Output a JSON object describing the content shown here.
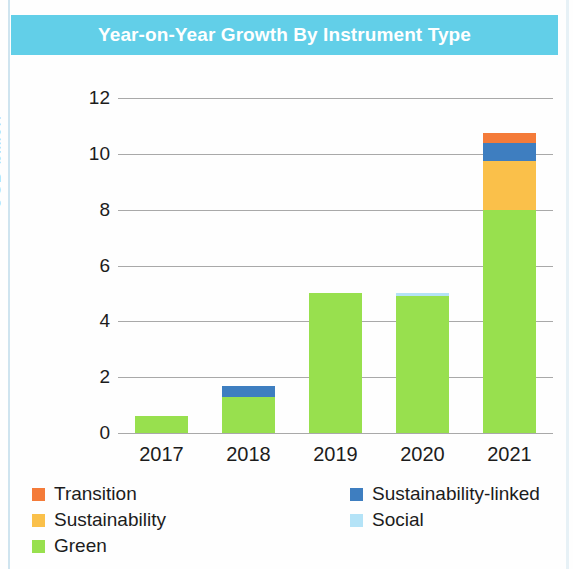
{
  "banner": {
    "title": "Year-on-Year Growth By Instrument Type"
  },
  "axis": {
    "y_title": "USD billion",
    "y_ticks": [
      "12",
      "10",
      "8",
      "6",
      "4",
      "2",
      "0"
    ],
    "x_ticks": [
      "2017",
      "2018",
      "2019",
      "2020",
      "2021"
    ]
  },
  "legend": {
    "left_column": [
      {
        "label": "Transition",
        "color": "#f47b39"
      },
      {
        "label": "Sustainability",
        "color": "#fac04a"
      },
      {
        "label": "Green",
        "color": "#98e04e"
      }
    ],
    "right_column": [
      {
        "label": "Sustainability-linked",
        "color": "#3e7ec0"
      },
      {
        "label": "Social",
        "color": "#b4e3f7"
      }
    ]
  },
  "chart_data": {
    "type": "bar",
    "stacked": true,
    "title": "Year-on-Year Growth By Instrument Type",
    "xlabel": "",
    "ylabel": "USD billion",
    "ylim": [
      0,
      12
    ],
    "ytick_step": 2,
    "grid": true,
    "legend_position": "bottom",
    "categories": [
      "2017",
      "2018",
      "2019",
      "2020",
      "2021"
    ],
    "series": [
      {
        "name": "Green",
        "color": "#98e04e",
        "values": [
          0.6,
          1.3,
          5.0,
          4.9,
          8.0
        ]
      },
      {
        "name": "Social",
        "color": "#b4e3f7",
        "values": [
          0,
          0,
          0,
          0.1,
          0
        ]
      },
      {
        "name": "Sustainability",
        "color": "#fac04a",
        "values": [
          0,
          0,
          0,
          0,
          1.75
        ]
      },
      {
        "name": "Sustainability-linked",
        "color": "#3e7ec0",
        "values": [
          0,
          0.4,
          0,
          0,
          0.65
        ]
      },
      {
        "name": "Transition",
        "color": "#f47b39",
        "values": [
          0,
          0,
          0,
          0,
          0.35
        ]
      }
    ],
    "totals": [
      0.6,
      1.7,
      5.0,
      5.0,
      10.75
    ]
  }
}
